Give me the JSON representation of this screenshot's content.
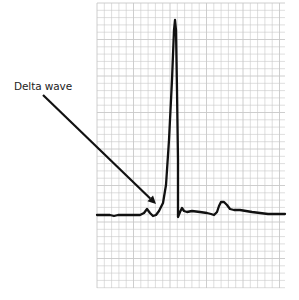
{
  "figure": {
    "annotation_label": "Delta wave",
    "grid": {
      "x0": 97,
      "y0": 3,
      "x1": 285,
      "y1": 288,
      "spacing": 7.3,
      "color": "#c8c8c8"
    },
    "trace_color": "#111111",
    "arrow": {
      "from": [
        43,
        95
      ],
      "to": [
        156,
        204
      ]
    },
    "trace_points": [
      [
        97,
        215
      ],
      [
        110,
        215
      ],
      [
        114,
        216
      ],
      [
        118,
        215
      ],
      [
        140,
        215
      ],
      [
        144,
        213
      ],
      [
        147,
        209
      ],
      [
        150,
        213
      ],
      [
        153,
        216
      ],
      [
        156,
        215
      ],
      [
        159,
        211
      ],
      [
        163,
        203
      ],
      [
        166,
        185
      ],
      [
        169,
        140
      ],
      [
        172,
        80
      ],
      [
        174,
        30
      ],
      [
        175,
        20
      ],
      [
        176,
        30
      ],
      [
        177,
        90
      ],
      [
        178,
        160
      ],
      [
        178,
        217
      ],
      [
        180,
        212
      ],
      [
        182,
        208
      ],
      [
        184,
        211
      ],
      [
        187,
        212
      ],
      [
        192,
        211
      ],
      [
        200,
        212
      ],
      [
        207,
        213
      ],
      [
        211,
        214
      ],
      [
        214,
        215
      ],
      [
        217,
        212
      ],
      [
        219,
        206
      ],
      [
        221,
        202
      ],
      [
        224,
        202
      ],
      [
        227,
        205
      ],
      [
        230,
        209
      ],
      [
        234,
        210
      ],
      [
        240,
        210
      ],
      [
        246,
        211
      ],
      [
        252,
        212
      ],
      [
        260,
        213
      ],
      [
        268,
        214
      ],
      [
        276,
        214
      ],
      [
        285,
        214
      ]
    ]
  }
}
